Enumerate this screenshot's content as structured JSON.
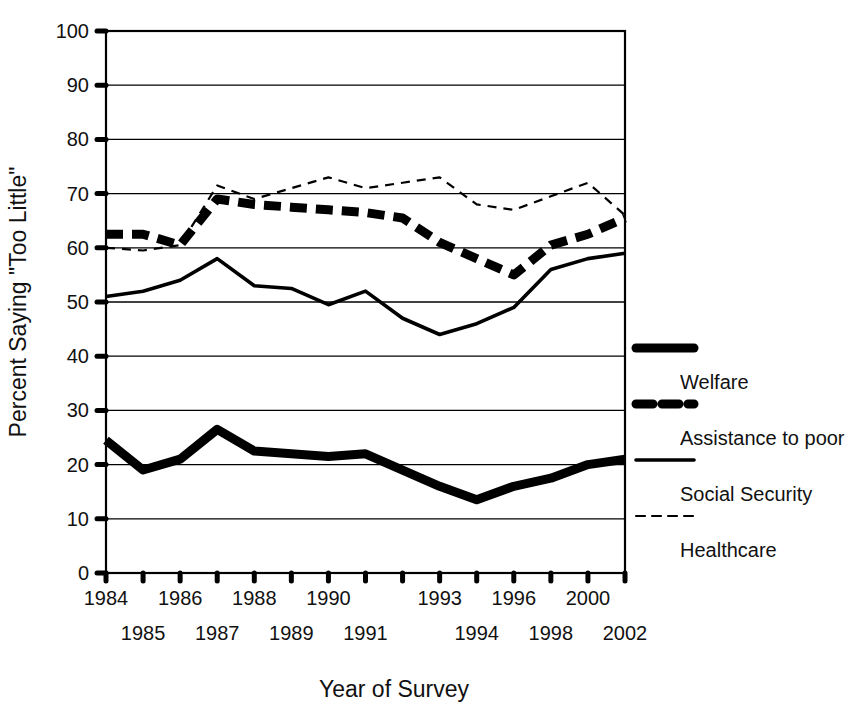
{
  "chart_data": {
    "type": "line",
    "title": "",
    "xlabel": "Year of Survey",
    "ylabel": "Percent Saying \"Too Little\"",
    "xlim": [
      0,
      14
    ],
    "ylim": [
      0,
      100
    ],
    "grid": true,
    "legend_position": "right",
    "categories": [
      "1984",
      "1985",
      "1986",
      "1987",
      "1988",
      "1989",
      "1990",
      "1991",
      "1992",
      "1993",
      "1994",
      "1996",
      "1998",
      "2000",
      "2002"
    ],
    "x_tick_labels_row1": [
      "1984",
      "",
      "1986",
      "",
      "1988",
      "",
      "1990",
      "",
      "",
      "1993",
      "",
      "1996",
      "",
      "2000",
      ""
    ],
    "x_tick_labels_row2": [
      "",
      "1985",
      "",
      "1987",
      "",
      "1989",
      "",
      "1991",
      "",
      "",
      "1994",
      "",
      "1998",
      "",
      "2002"
    ],
    "y_tick_labels": [
      "0",
      "10",
      "20",
      "30",
      "40",
      "50",
      "60",
      "70",
      "80",
      "90",
      "100"
    ],
    "y_ticks": [
      0,
      10,
      20,
      30,
      40,
      50,
      60,
      70,
      80,
      90,
      100
    ],
    "series": [
      {
        "name": "Welfare",
        "style": "thick-solid",
        "values": [
          24.5,
          19.0,
          21.0,
          26.5,
          22.5,
          22.0,
          21.5,
          22.0,
          19.0,
          16.0,
          13.5,
          16.0,
          17.5,
          20.0,
          21.0
        ]
      },
      {
        "name": "Assistance to poor",
        "style": "thick-dashed",
        "values": [
          62.5,
          62.5,
          60.5,
          69.0,
          68.0,
          67.5,
          67.0,
          66.5,
          65.5,
          61.0,
          58.0,
          55.0,
          60.5,
          62.5,
          65.5
        ]
      },
      {
        "name": "Social Security",
        "style": "thin-solid",
        "values": [
          51.0,
          52.0,
          54.0,
          58.0,
          53.0,
          52.5,
          49.5,
          52.0,
          47.0,
          44.0,
          46.0,
          49.0,
          56.0,
          58.0,
          59.0
        ]
      },
      {
        "name": "Healthcare",
        "style": "thin-dashed",
        "values": [
          60.0,
          59.5,
          60.5,
          71.5,
          69.0,
          71.0,
          73.0,
          71.0,
          72.0,
          73.0,
          68.0,
          67.0,
          69.5,
          72.0,
          66.0
        ]
      }
    ]
  },
  "legend": {
    "items": [
      {
        "label": "Welfare",
        "swatch": "thick-solid"
      },
      {
        "label": "Assistance to poor",
        "swatch": "thick-dashed"
      },
      {
        "label": "Social Security",
        "swatch": "thin-solid"
      },
      {
        "label": "Healthcare",
        "swatch": "thin-dashed"
      }
    ]
  }
}
